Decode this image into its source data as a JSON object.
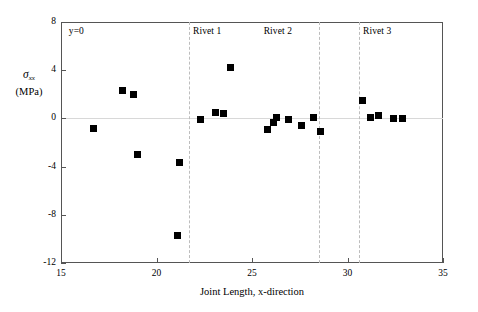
{
  "chart_data": {
    "type": "scatter",
    "title": "",
    "xlabel": "Joint Length, x-direction",
    "ylabel": "σxx (MPa)",
    "ylabel_symbol": "σ",
    "ylabel_subscript": "xx",
    "ylabel_units": "(MPa)",
    "xlim": [
      15,
      35
    ],
    "ylim": [
      -12,
      8
    ],
    "xticks": [
      15,
      20,
      25,
      30,
      35
    ],
    "yticks": [
      8,
      4,
      0,
      -4,
      -8,
      -12
    ],
    "xtick_labels": [
      "15",
      "20",
      "25",
      "30",
      "35"
    ],
    "ytick_labels": [
      "8",
      "4",
      "0",
      "-4",
      "-8",
      "-12"
    ],
    "grid": false,
    "zero_line": true,
    "legend": "none",
    "marker_style": "filled-square",
    "marker_color": "#000000",
    "series": [
      {
        "name": "sigma_xx at y=0",
        "x": [
          16.7,
          18.2,
          18.8,
          19.0,
          21.1,
          21.2,
          22.3,
          23.1,
          23.5,
          23.9,
          25.8,
          26.1,
          26.3,
          26.9,
          27.6,
          28.2,
          28.6,
          30.8,
          31.2,
          31.6,
          32.4,
          32.9
        ],
        "y": [
          -0.8,
          2.3,
          2.0,
          -3.0,
          -9.7,
          -3.7,
          -0.1,
          0.5,
          0.4,
          4.2,
          -0.9,
          -0.3,
          0.1,
          -0.1,
          -0.6,
          0.1,
          -1.1,
          1.5,
          0.1,
          0.2,
          0.0,
          0.0
        ]
      }
    ],
    "annotations": [
      {
        "name": "y-equals-zero",
        "text": "y=0",
        "x": 15.2,
        "y": 8.0
      },
      {
        "name": "rivet-1",
        "text": "Rivet 1",
        "x": 21.7,
        "y": 8.0
      },
      {
        "name": "rivet-2",
        "text": "Rivet 2",
        "x": 25.4,
        "y": 8.0
      },
      {
        "name": "rivet-3",
        "text": "Rivet 3",
        "x": 30.6,
        "y": 8.0
      }
    ],
    "vlines": [
      {
        "name": "rivet-1-line",
        "x": 21.7
      },
      {
        "name": "rivet-2-line",
        "x": 28.5
      },
      {
        "name": "rivet-3-line",
        "x": 30.6
      }
    ],
    "colors": {
      "marker": "#000000",
      "axis": "#555555",
      "gridline": "#d8d8d8",
      "vline": "#bdbdbd",
      "background": "#ffffff"
    }
  }
}
